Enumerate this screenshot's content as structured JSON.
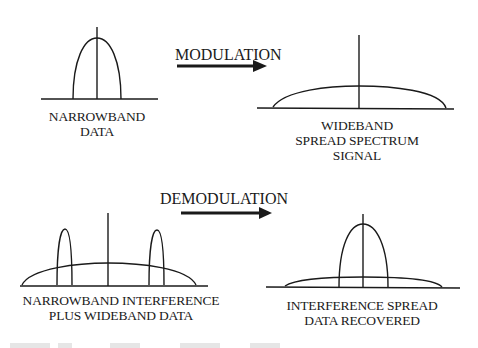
{
  "diagram": {
    "top": {
      "arrow_label": "MODULATION",
      "left": {
        "caption": [
          "NARROWBAND",
          "DATA"
        ]
      },
      "right": {
        "caption": [
          "WIDEBAND",
          "SPREAD SPECTRUM",
          "SIGNAL"
        ]
      }
    },
    "bottom": {
      "arrow_label": "DEMODULATION",
      "left": {
        "caption": [
          "NARROWBAND INTERFERENCE",
          "PLUS WIDEBAND DATA"
        ]
      },
      "right": {
        "caption": [
          "INTERFERENCE SPREAD",
          "DATA RECOVERED"
        ]
      }
    }
  },
  "colors": {
    "ink": "#1a1a1a",
    "background": "#ffffff"
  }
}
